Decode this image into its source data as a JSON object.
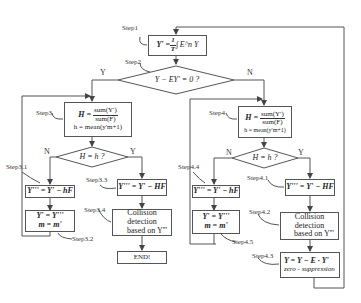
{
  "diagram": {
    "type": "flowchart",
    "nodes": {
      "step1": {
        "label": "Step1",
        "formula": "Y' = 1/T ∫ E^n Y",
        "lhs": "Y' =",
        "frac_num": "1",
        "frac_den": "T",
        "rhs": "∫ E^n Y"
      },
      "step2": {
        "label": "Step2",
        "condition": "Y − EY' = 0 ?"
      },
      "step3": {
        "label": "Step3",
        "lhs": "H =",
        "frac_num": "sum(Y')",
        "frac_den": "sum(F)",
        "line2": "h = mean(y'm+1)"
      },
      "decision3": {
        "condition": "H = h ?"
      },
      "step3_1": {
        "label": "Step3.1",
        "formula": "Y''' = Y' − hF"
      },
      "step3_2": {
        "label": "Step3.2",
        "line1": "Y' = Y'''",
        "line2": "m = m'"
      },
      "step3_3": {
        "label": "Step3.3",
        "formula": "Y''' = Y' − HF"
      },
      "step3_4": {
        "label": "Step3.4",
        "line1": "Collision detection",
        "line2": "based on Y'''"
      },
      "end": {
        "label": "END!"
      },
      "step4": {
        "label": "Step4",
        "lhs": "H =",
        "frac_num": "sum(Y')",
        "frac_den": "sum(F)",
        "line2": "h = mean(y'm+1)"
      },
      "decision4": {
        "condition": "H = h ?"
      },
      "step4_4": {
        "label": "Step4.4",
        "formula": "Y''' = Y' − hF"
      },
      "step4_5": {
        "label": "Step4.5",
        "line1": "Y' = Y'''",
        "line2": "m = m'"
      },
      "step4_1": {
        "label": "Step4.1",
        "formula": "Y''' = Y' − HF"
      },
      "step4_2": {
        "label": "Step4.2",
        "line1": "Collision detection",
        "line2": "based on Y'''"
      },
      "step4_3": {
        "label": "Step4.3",
        "line1": "Y = Y − E · Y'",
        "line2": "zero - suppression"
      }
    },
    "branch_labels": {
      "step2_yes": "Y",
      "step2_no": "N",
      "d3_no": "N",
      "d3_yes": "Y",
      "d4_no": "N",
      "d4_yes": "Y"
    },
    "colors": {
      "line": "#555555",
      "background": "#ffffff",
      "text": "#222222"
    }
  }
}
